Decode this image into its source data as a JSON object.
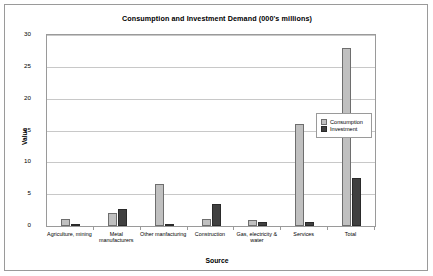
{
  "chart_data": {
    "type": "bar",
    "title": "Consumption and Investment Demand (000's millions)",
    "xlabel": "Source",
    "ylabel": "Value",
    "ylim": [
      0,
      30
    ],
    "yticks": [
      "0",
      "5",
      "10",
      "15",
      "20",
      "25",
      "30"
    ],
    "grid": true,
    "legend_position": "right",
    "categories": [
      "Agriculture, mining",
      "Metal manufacturers",
      "Other manfacturing",
      "Construction",
      "Gas, electricity & water",
      "Services",
      "Total"
    ],
    "series": [
      {
        "name": "Consumption",
        "color": "#c0c0c0",
        "values": [
          1.1,
          2.0,
          6.6,
          1.1,
          1.0,
          16.0,
          28.0
        ]
      },
      {
        "name": "Investment",
        "color": "#404040",
        "values": [
          0.35,
          2.7,
          0.1,
          3.4,
          0.7,
          0.7,
          7.5
        ]
      }
    ]
  }
}
